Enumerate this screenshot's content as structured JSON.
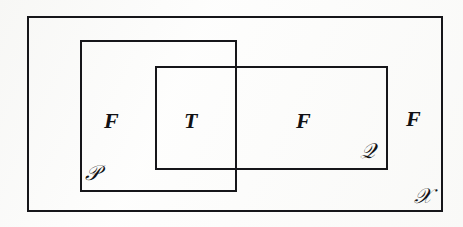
{
  "diagram": {
    "type": "venn-rectangles",
    "background_color": "#fdfdfc",
    "line_color": "#16161a",
    "line_width_px": 2,
    "canvas": {
      "width": 463,
      "height": 227
    },
    "sets": [
      {
        "id": "universe",
        "label": "𝒳",
        "plain_label": "X",
        "name": "universe-set",
        "rect": {
          "x": 27,
          "y": 16,
          "width": 416,
          "height": 196
        },
        "label_position": "bottom-right-inside"
      },
      {
        "id": "set-p",
        "label": "𝒫",
        "plain_label": "P",
        "name": "set-p",
        "rect": {
          "x": 80,
          "y": 40,
          "width": 157,
          "height": 152
        },
        "label_position": "bottom-left-inside"
      },
      {
        "id": "set-q",
        "label": "𝒬",
        "plain_label": "Q",
        "name": "set-q",
        "rect": {
          "x": 155,
          "y": 66,
          "width": 233,
          "height": 104
        },
        "label_position": "bottom-right-inside"
      }
    ],
    "regions": [
      {
        "id": "p-only",
        "label": "F",
        "description": "inside P, outside Q",
        "x": 104,
        "y": 110
      },
      {
        "id": "intersection",
        "label": "T",
        "description": "inside P and Q",
        "x": 184,
        "y": 110
      },
      {
        "id": "q-only",
        "label": "F",
        "description": "inside Q, outside P",
        "x": 296,
        "y": 110
      },
      {
        "id": "outside-both",
        "label": "F",
        "description": "inside X, outside P and Q",
        "x": 406,
        "y": 108
      }
    ]
  }
}
